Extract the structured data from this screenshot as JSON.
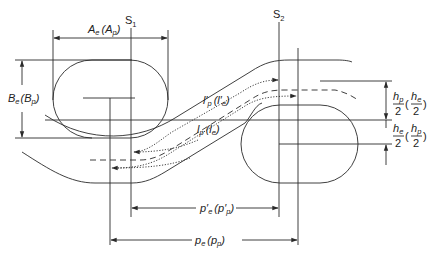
{
  "diagram": {
    "title": "",
    "labels": {
      "s1": "S",
      "s1_sub": "1",
      "s2": "S",
      "s2_sub": "2",
      "ae_main": "A",
      "ae_sub": "e",
      "ae_paren": "(A",
      "ae_paren_sub": "p",
      "ae_close": ")",
      "be_main": "B",
      "be_sub": "e",
      "be_paren": "(B",
      "be_paren_sub": "p",
      "be_close": ")",
      "lp_prime": "l′",
      "lp_prime_sub": "p",
      "lp_prime_paren": "(l′",
      "lp_prime_paren_sub": "e",
      "lp_prime_close": ")",
      "lp": "l",
      "lp_sub": "p",
      "lp_paren": "(l",
      "lp_paren_sub": "e",
      "lp_close": ")",
      "pe_prime": "p′",
      "pe_prime_sub": "e",
      "pe_prime_paren": "(p′",
      "pe_prime_paren_sub": "p",
      "pe_prime_close": ")",
      "pe": "p",
      "pe_sub": "e",
      "pe_paren": "(p",
      "pe_paren_sub": "p",
      "pe_close": ")",
      "hp_num": "h",
      "hp_num_sub": "p",
      "hp_den": "2",
      "hp_paren_num": "h",
      "hp_paren_num_sub": "e",
      "hp_paren_den": "2",
      "he_num": "h",
      "he_num_sub": "e",
      "he_den": "2",
      "he_paren_num": "h",
      "he_paren_num_sub": "p",
      "he_paren_den": "2",
      "open_paren": "(",
      "close_paren": ")"
    }
  }
}
